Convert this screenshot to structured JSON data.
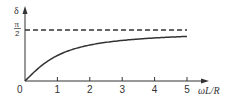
{
  "chart_data": {
    "type": "line",
    "title": "",
    "xlabel": "ωL/R",
    "ylabel": "δ",
    "xlim": [
      0,
      5
    ],
    "ylim": [
      0,
      1.5708
    ],
    "x_ticks": [
      "0",
      "1",
      "2",
      "3",
      "4",
      "5"
    ],
    "y_ticks": [
      "π/2"
    ],
    "grid": false,
    "legend": null,
    "series": [
      {
        "name": "δ = arctan(ωL/R)",
        "style": "solid",
        "x": [
          0,
          0.25,
          0.5,
          0.75,
          1,
          1.5,
          2,
          2.5,
          3,
          3.5,
          4,
          4.5,
          5
        ],
        "values": [
          0,
          0.245,
          0.464,
          0.644,
          0.785,
          0.983,
          1.107,
          1.19,
          1.249,
          1.292,
          1.326,
          1.352,
          1.373
        ]
      },
      {
        "name": "asymptote π/2",
        "style": "dashed",
        "x": [
          0,
          5
        ],
        "values": [
          1.5708,
          1.5708
        ]
      }
    ],
    "annotations": []
  },
  "labels": {
    "y_axis": "δ",
    "y_tick_num": "π",
    "y_tick_den": "2",
    "x_axis": "ωL/R",
    "x_ticks": [
      "0",
      "1",
      "2",
      "3",
      "4",
      "5"
    ]
  }
}
